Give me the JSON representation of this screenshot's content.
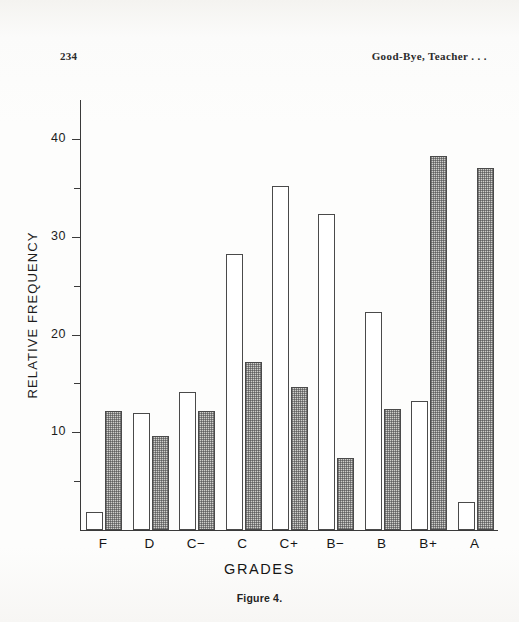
{
  "page": {
    "folio": "234",
    "running_head": "Good-Bye, Teacher . . .",
    "caption": "Figure 4."
  },
  "chart_data": {
    "type": "bar",
    "title": "",
    "xlabel": "GRADES",
    "ylabel": "RELATIVE FREQUENCY",
    "categories": [
      "F",
      "D",
      "C−",
      "C",
      "C+",
      "B−",
      "B",
      "B+",
      "A"
    ],
    "series": [
      {
        "name": "open",
        "style": "white",
        "values": [
          1.8,
          12.0,
          14.1,
          28.2,
          35.2,
          32.3,
          22.3,
          13.2,
          2.9
        ]
      },
      {
        "name": "shaded",
        "style": "stippled",
        "values": [
          12.2,
          9.6,
          12.2,
          17.2,
          14.6,
          7.4,
          12.4,
          38.3,
          37.0
        ]
      }
    ],
    "ylim": [
      0,
      44
    ],
    "y_major_ticks": [
      10,
      20,
      30,
      40
    ],
    "y_minor_ticks": [
      5,
      15,
      25,
      35
    ],
    "y_tick_labels": [
      "10",
      "20",
      "30",
      "40"
    ],
    "grid": false,
    "legend": "none"
  }
}
